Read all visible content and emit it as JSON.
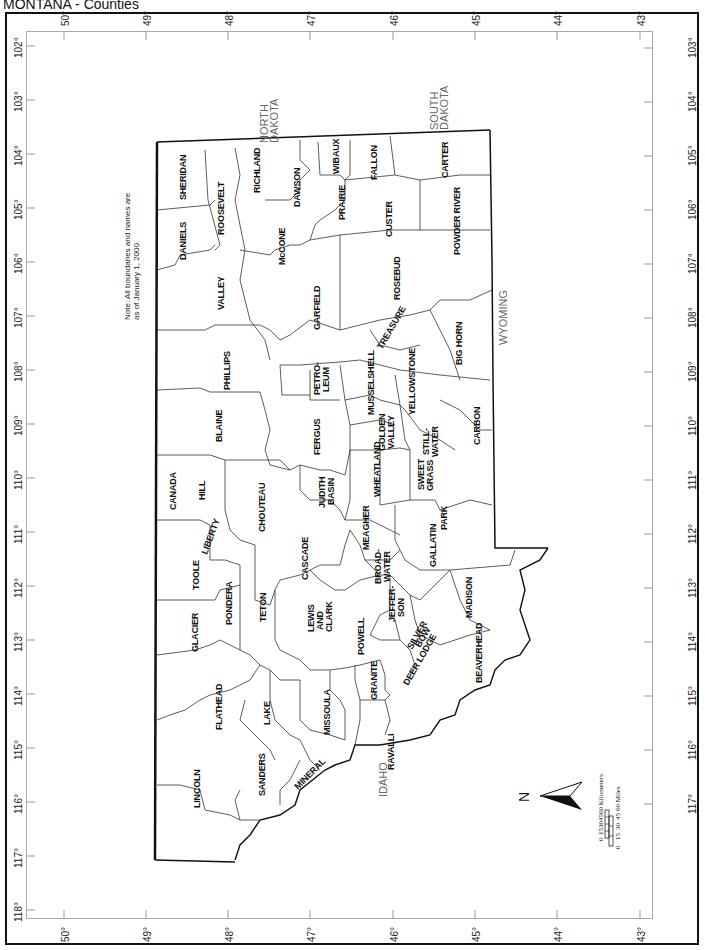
{
  "title": "MONTANA - Counties",
  "note_line1": "Note: All boundaries and names are",
  "note_line2": "as of January 1, 2000.",
  "latitude_ticks": [
    "50°",
    "49°",
    "48°",
    "47°",
    "46°",
    "45°",
    "44°",
    "43°"
  ],
  "longitude_ticks_left": [
    "102°",
    "103°",
    "104°",
    "105°",
    "106°",
    "107°",
    "108°",
    "109°",
    "110°",
    "111°",
    "112°",
    "113°",
    "114°",
    "115°",
    "116°",
    "117°",
    "118°"
  ],
  "longitude_ticks_right": [
    "103°",
    "104°",
    "105°",
    "106°",
    "107°",
    "108°",
    "109°",
    "110°",
    "111°",
    "112°",
    "113°",
    "114°",
    "115°",
    "116°",
    "117°"
  ],
  "neighbors": {
    "canada": "CANADA",
    "north_dakota": [
      "NORTH",
      "DAKOTA"
    ],
    "south_dakota": [
      "SOUTH",
      "DAKOTA"
    ],
    "wyoming": "WYOMING",
    "idaho": "IDAHO"
  },
  "counties": {
    "sheridan": "SHERIDAN",
    "daniels": "DANIELS",
    "roosevelt": "ROOSEVELT",
    "richland": "RICHLAND",
    "dawson": "DAWSON",
    "wibaux": "WIBAUX",
    "fallon": "FALLON",
    "carter": "CARTER",
    "prairie": "PRAIRIE",
    "mccone": "McCONE",
    "custer": "CUSTER",
    "powder_river": "POWDER RIVER",
    "valley": "VALLEY",
    "garfield": "GARFIELD",
    "rosebud": "ROSEBUD",
    "treasure": "TREASURE",
    "big_horn": "BIG HORN",
    "phillips": "PHILLIPS",
    "petroleum": [
      "PETRO-",
      "LEUM"
    ],
    "musselshell": "MUSSELSHELL",
    "yellowstone": "YELLOWSTONE",
    "blaine": "BLAINE",
    "fergus": "FERGUS",
    "golden_valley": [
      "GOLDEN",
      "VALLEY"
    ],
    "stillwater": [
      "STILL-",
      "WATER"
    ],
    "carbon": "CARBON",
    "hill": "HILL",
    "chouteau": "CHOUTEAU",
    "judith_basin": [
      "JUDITH",
      "BASIN"
    ],
    "wheatland": "WHEATLAND",
    "sweet_grass": [
      "SWEET",
      "GRASS"
    ],
    "liberty": "LIBERTY",
    "meagher": "MEAGHER",
    "park": "PARK",
    "toole": "TOOLE",
    "cascade": "CASCADE",
    "broadwater": [
      "BROAD-",
      "WATER"
    ],
    "gallatin": "GALLATIN",
    "pondera": "PONDERA",
    "teton": "TETON",
    "lewis_and_clark": [
      "LEWIS",
      "AND",
      "CLARK"
    ],
    "jefferson": [
      "JEFFER-",
      "SON"
    ],
    "madison": "MADISON",
    "glacier": "GLACIER",
    "powell": "POWELL",
    "silver_bow": [
      "SILVER",
      "BOW"
    ],
    "deer_lodge": "DEER LODGE",
    "granite": "GRANITE",
    "beaverhead": "BEAVERHEAD",
    "flathead": "FLATHEAD",
    "lake": "LAKE",
    "missoula": "MISSOULA",
    "ravalli": "RAVALLI",
    "lincoln": "LINCOLN",
    "sanders": "SANDERS",
    "mineral": "MINERAL"
  },
  "north_arrow": "N",
  "scale_bar": {
    "km_ticks": [
      "0",
      "15",
      "30",
      "45",
      "60 Kilometers"
    ],
    "mi_ticks": [
      "0",
      "15",
      "30",
      "45",
      "60 Miles"
    ]
  }
}
